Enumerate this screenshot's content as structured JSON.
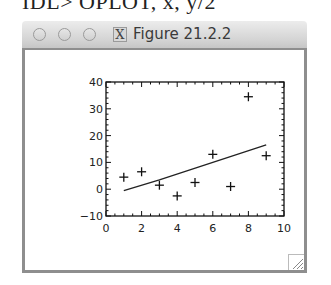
{
  "command_line": "IDL> OPLOT, x, y/2",
  "window": {
    "title": "Figure 21.2.2",
    "buttons": [
      {
        "name": "close",
        "icon": "circle-icon"
      },
      {
        "name": "minimize",
        "icon": "circle-icon"
      },
      {
        "name": "zoom",
        "icon": "circle-icon"
      },
      {
        "name": "x11",
        "icon": "x-icon",
        "label": "X"
      }
    ],
    "resize_grip": "resize-grip-icon"
  },
  "chart_data": {
    "type": "scatter",
    "title": "",
    "xlabel": "",
    "ylabel": "",
    "xlim": [
      0,
      10
    ],
    "ylim": [
      -10,
      40
    ],
    "x_ticks": [
      "0",
      "2",
      "4",
      "6",
      "8",
      "10"
    ],
    "y_ticks": [
      "-10",
      "0",
      "10",
      "20",
      "30",
      "40"
    ],
    "grid": false,
    "legend": null,
    "series": [
      {
        "name": "data",
        "style": "plus-markers",
        "x": [
          1,
          2,
          3,
          4,
          5,
          6,
          7,
          8,
          9
        ],
        "y": [
          4.5,
          6.5,
          1.5,
          -2.5,
          2.5,
          13,
          1,
          34.5,
          12.5
        ]
      },
      {
        "name": "fit",
        "style": "line",
        "x": [
          1,
          3,
          6,
          9
        ],
        "y": [
          -0.5,
          3.5,
          10,
          16.5
        ]
      }
    ]
  }
}
